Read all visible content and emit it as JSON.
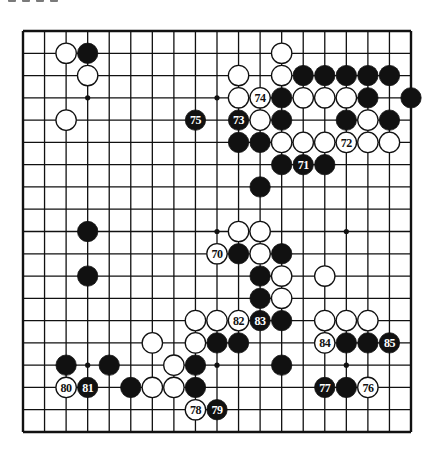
{
  "title_fragment": "",
  "board": {
    "size": 19,
    "left": 23,
    "top": 31,
    "right": 411,
    "bottom": 432,
    "line_color": "#111111",
    "stone_black": "#111111",
    "stone_white": "#ffffff",
    "star_points": [
      [
        3,
        3
      ],
      [
        9,
        3
      ],
      [
        15,
        3
      ],
      [
        3,
        9
      ],
      [
        9,
        9
      ],
      [
        15,
        9
      ],
      [
        3,
        15
      ],
      [
        9,
        15
      ],
      [
        15,
        15
      ]
    ]
  },
  "stones": [
    {
      "color": "black",
      "col": 3,
      "row": 1
    },
    {
      "color": "black",
      "col": 13,
      "row": 2
    },
    {
      "color": "black",
      "col": 14,
      "row": 2
    },
    {
      "color": "black",
      "col": 15,
      "row": 2
    },
    {
      "color": "black",
      "col": 16,
      "row": 2
    },
    {
      "color": "black",
      "col": 17,
      "row": 2
    },
    {
      "color": "black",
      "col": 12,
      "row": 3
    },
    {
      "color": "black",
      "col": 16,
      "row": 3
    },
    {
      "color": "black",
      "col": 18,
      "row": 3
    },
    {
      "color": "black",
      "col": 12,
      "row": 4
    },
    {
      "color": "black",
      "col": 15,
      "row": 4
    },
    {
      "color": "black",
      "col": 17,
      "row": 4
    },
    {
      "color": "black",
      "col": 10,
      "row": 5
    },
    {
      "color": "black",
      "col": 11,
      "row": 5
    },
    {
      "color": "black",
      "col": 12,
      "row": 6
    },
    {
      "color": "black",
      "col": 14,
      "row": 6
    },
    {
      "color": "black",
      "col": 11,
      "row": 7
    },
    {
      "color": "black",
      "col": 3,
      "row": 9
    },
    {
      "color": "black",
      "col": 10,
      "row": 10
    },
    {
      "color": "black",
      "col": 12,
      "row": 10
    },
    {
      "color": "black",
      "col": 3,
      "row": 11
    },
    {
      "color": "black",
      "col": 11,
      "row": 11
    },
    {
      "color": "black",
      "col": 11,
      "row": 12
    },
    {
      "color": "black",
      "col": 12,
      "row": 13
    },
    {
      "color": "black",
      "col": 9,
      "row": 14
    },
    {
      "color": "black",
      "col": 10,
      "row": 14
    },
    {
      "color": "black",
      "col": 15,
      "row": 14
    },
    {
      "color": "black",
      "col": 16,
      "row": 14
    },
    {
      "color": "black",
      "col": 2,
      "row": 15
    },
    {
      "color": "black",
      "col": 4,
      "row": 15
    },
    {
      "color": "black",
      "col": 8,
      "row": 15
    },
    {
      "color": "black",
      "col": 12,
      "row": 15
    },
    {
      "color": "black",
      "col": 5,
      "row": 16
    },
    {
      "color": "black",
      "col": 8,
      "row": 16
    },
    {
      "color": "black",
      "col": 15,
      "row": 16
    },
    {
      "color": "black",
      "col": 13,
      "row": 6,
      "label": "71"
    },
    {
      "color": "black",
      "col": 10,
      "row": 4,
      "label": "73"
    },
    {
      "color": "black",
      "col": 8,
      "row": 4,
      "label": "75"
    },
    {
      "color": "black",
      "col": 14,
      "row": 16,
      "label": "77"
    },
    {
      "color": "black",
      "col": 9,
      "row": 17,
      "label": "79"
    },
    {
      "color": "black",
      "col": 3,
      "row": 16,
      "label": "81"
    },
    {
      "color": "black",
      "col": 11,
      "row": 13,
      "label": "83"
    },
    {
      "color": "black",
      "col": 17,
      "row": 14,
      "label": "85"
    },
    {
      "color": "white",
      "col": 2,
      "row": 1
    },
    {
      "color": "white",
      "col": 12,
      "row": 1
    },
    {
      "color": "white",
      "col": 3,
      "row": 2
    },
    {
      "color": "white",
      "col": 10,
      "row": 2
    },
    {
      "color": "white",
      "col": 12,
      "row": 2
    },
    {
      "color": "white",
      "col": 10,
      "row": 3
    },
    {
      "color": "white",
      "col": 13,
      "row": 3
    },
    {
      "color": "white",
      "col": 14,
      "row": 3
    },
    {
      "color": "white",
      "col": 15,
      "row": 3
    },
    {
      "color": "white",
      "col": 2,
      "row": 4
    },
    {
      "color": "white",
      "col": 11,
      "row": 4
    },
    {
      "color": "white",
      "col": 16,
      "row": 4
    },
    {
      "color": "white",
      "col": 12,
      "row": 5
    },
    {
      "color": "white",
      "col": 13,
      "row": 5
    },
    {
      "color": "white",
      "col": 14,
      "row": 5
    },
    {
      "color": "white",
      "col": 16,
      "row": 5
    },
    {
      "color": "white",
      "col": 17,
      "row": 5
    },
    {
      "color": "white",
      "col": 10,
      "row": 9
    },
    {
      "color": "white",
      "col": 11,
      "row": 9
    },
    {
      "color": "white",
      "col": 11,
      "row": 10
    },
    {
      "color": "white",
      "col": 12,
      "row": 11
    },
    {
      "color": "white",
      "col": 14,
      "row": 11
    },
    {
      "color": "white",
      "col": 12,
      "row": 12
    },
    {
      "color": "white",
      "col": 8,
      "row": 13
    },
    {
      "color": "white",
      "col": 9,
      "row": 13
    },
    {
      "color": "white",
      "col": 14,
      "row": 13
    },
    {
      "color": "white",
      "col": 15,
      "row": 13
    },
    {
      "color": "white",
      "col": 16,
      "row": 13
    },
    {
      "color": "white",
      "col": 6,
      "row": 14
    },
    {
      "color": "white",
      "col": 8,
      "row": 14
    },
    {
      "color": "white",
      "col": 7,
      "row": 15
    },
    {
      "color": "white",
      "col": 6,
      "row": 16
    },
    {
      "color": "white",
      "col": 7,
      "row": 16
    },
    {
      "color": "white",
      "col": 9,
      "row": 10,
      "label": "70"
    },
    {
      "color": "white",
      "col": 15,
      "row": 5,
      "label": "72"
    },
    {
      "color": "white",
      "col": 11,
      "row": 3,
      "label": "74"
    },
    {
      "color": "white",
      "col": 16,
      "row": 16,
      "label": "76"
    },
    {
      "color": "white",
      "col": 8,
      "row": 17,
      "label": "78"
    },
    {
      "color": "white",
      "col": 2,
      "row": 16,
      "label": "80"
    },
    {
      "color": "white",
      "col": 10,
      "row": 13,
      "label": "82"
    },
    {
      "color": "white",
      "col": 14,
      "row": 14,
      "label": "84"
    }
  ]
}
